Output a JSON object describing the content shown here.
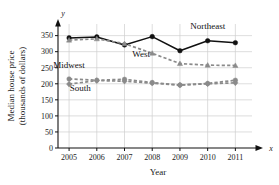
{
  "chart_data": {
    "type": "line",
    "title": "",
    "xlabel": "Year",
    "ylabel": "Median house price (thousands of dollars)",
    "ylabel_line1": "Median house price",
    "ylabel_line2": "(thousands of dollars)",
    "x_axis_var": "x",
    "y_axis_var": "y",
    "categories": [
      2005,
      2006,
      2007,
      2008,
      2009,
      2010,
      2011
    ],
    "xticklabels": [
      "2005",
      "2006",
      "2007",
      "2008",
      "2009",
      "2010",
      "2011"
    ],
    "yticks": [
      0,
      50,
      100,
      150,
      200,
      250,
      300,
      350
    ],
    "yticklabels": [
      "0",
      "50",
      "100",
      "150",
      "200",
      "250",
      "300",
      "350"
    ],
    "ylim": [
      0,
      380
    ],
    "xlim": [
      2004.6,
      2011.6
    ],
    "grid": true,
    "legend": "inline-labels",
    "series": [
      {
        "name": "Northeast",
        "values": [
          343,
          346,
          321,
          347,
          303,
          334,
          328
        ],
        "style": "solid",
        "color": "#111111",
        "marker": "circle"
      },
      {
        "name": "West",
        "values": [
          336,
          340,
          325,
          295,
          263,
          258,
          257
        ],
        "style": "dashed",
        "color": "#8a8a8a",
        "marker": "triangle"
      },
      {
        "name": "Midwest",
        "values": [
          215,
          211,
          214,
          204,
          196,
          201,
          211
        ],
        "style": "dashed",
        "color": "#8a8a8a",
        "marker": "circle"
      },
      {
        "name": "South",
        "values": [
          199,
          210,
          208,
          202,
          196,
          200,
          203
        ],
        "style": "dashed",
        "color": "#8a8a8a",
        "marker": "diamond"
      }
    ],
    "annotations": [
      {
        "text": "Northeast",
        "x": 2010.0,
        "y": 372,
        "color": "#111111"
      },
      {
        "text": "West",
        "x": 2007.6,
        "y": 283,
        "color": "#777777"
      },
      {
        "text": "Midwest",
        "x": 2005.0,
        "y": 248,
        "color": "#777777"
      },
      {
        "text": "South",
        "x": 2005.4,
        "y": 177,
        "color": "#777777"
      }
    ]
  },
  "colors": {
    "axis": "#111111",
    "grid": "#cfcfcf",
    "northeast": "#111111",
    "gray_series": "#8a8a8a",
    "text": "#1a1a1a",
    "gray_text": "#777777",
    "background": "#ffffff"
  }
}
